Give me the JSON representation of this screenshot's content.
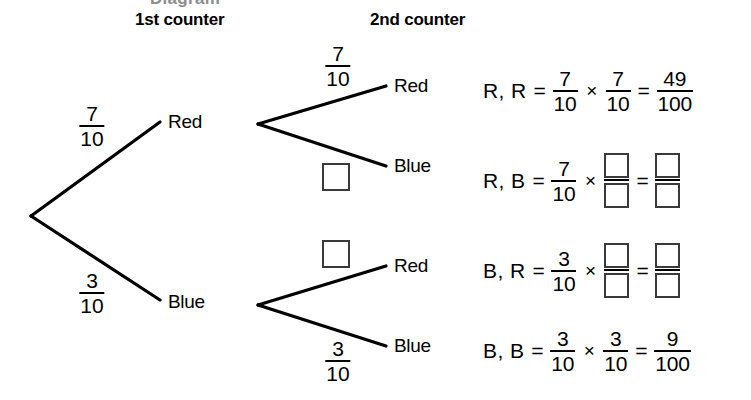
{
  "page": {
    "clipped_top_text": "Diagram",
    "background_color": "#ffffff",
    "line_color": "#000000",
    "box_border_color": "#3a3a3a"
  },
  "headers": {
    "first": "1st counter",
    "second": "2nd counter"
  },
  "tree": {
    "level1": [
      {
        "label": "Red",
        "probability": {
          "numerator": "7",
          "denominator": "10"
        }
      },
      {
        "label": "Blue",
        "probability": {
          "numerator": "3",
          "denominator": "10"
        }
      }
    ],
    "level2": [
      {
        "parent": "Red",
        "label": "Red",
        "probability": {
          "numerator": "7",
          "denominator": "10"
        },
        "blank": false
      },
      {
        "parent": "Red",
        "label": "Blue",
        "probability": {
          "numerator": "",
          "denominator": ""
        },
        "blank": true
      },
      {
        "parent": "Blue",
        "label": "Red",
        "probability": {
          "numerator": "",
          "denominator": ""
        },
        "blank": true
      },
      {
        "parent": "Blue",
        "label": "Blue",
        "probability": {
          "numerator": "3",
          "denominator": "10"
        },
        "blank": false
      }
    ]
  },
  "equations": [
    {
      "outcome": "R, R",
      "eq1": "=",
      "factor1": {
        "numerator": "7",
        "denominator": "10"
      },
      "times": "×",
      "factor2": {
        "numerator": "7",
        "denominator": "10",
        "blank": false
      },
      "eq2": "=",
      "result": {
        "numerator": "49",
        "denominator": "100",
        "blank": false
      }
    },
    {
      "outcome": "R, B",
      "eq1": "=",
      "factor1": {
        "numerator": "7",
        "denominator": "10"
      },
      "times": "×",
      "factor2": {
        "numerator": "",
        "denominator": "",
        "blank": true
      },
      "eq2": "=",
      "result": {
        "numerator": "",
        "denominator": "",
        "blank": true
      }
    },
    {
      "outcome": "B, R",
      "eq1": "=",
      "factor1": {
        "numerator": "3",
        "denominator": "10"
      },
      "times": "×",
      "factor2": {
        "numerator": "",
        "denominator": "",
        "blank": true
      },
      "eq2": "=",
      "result": {
        "numerator": "",
        "denominator": "",
        "blank": true
      }
    },
    {
      "outcome": "B, B",
      "eq1": "=",
      "factor1": {
        "numerator": "3",
        "denominator": "10"
      },
      "times": "×",
      "factor2": {
        "numerator": "3",
        "denominator": "10",
        "blank": false
      },
      "eq2": "=",
      "result": {
        "numerator": "9",
        "denominator": "100",
        "blank": false
      }
    }
  ]
}
